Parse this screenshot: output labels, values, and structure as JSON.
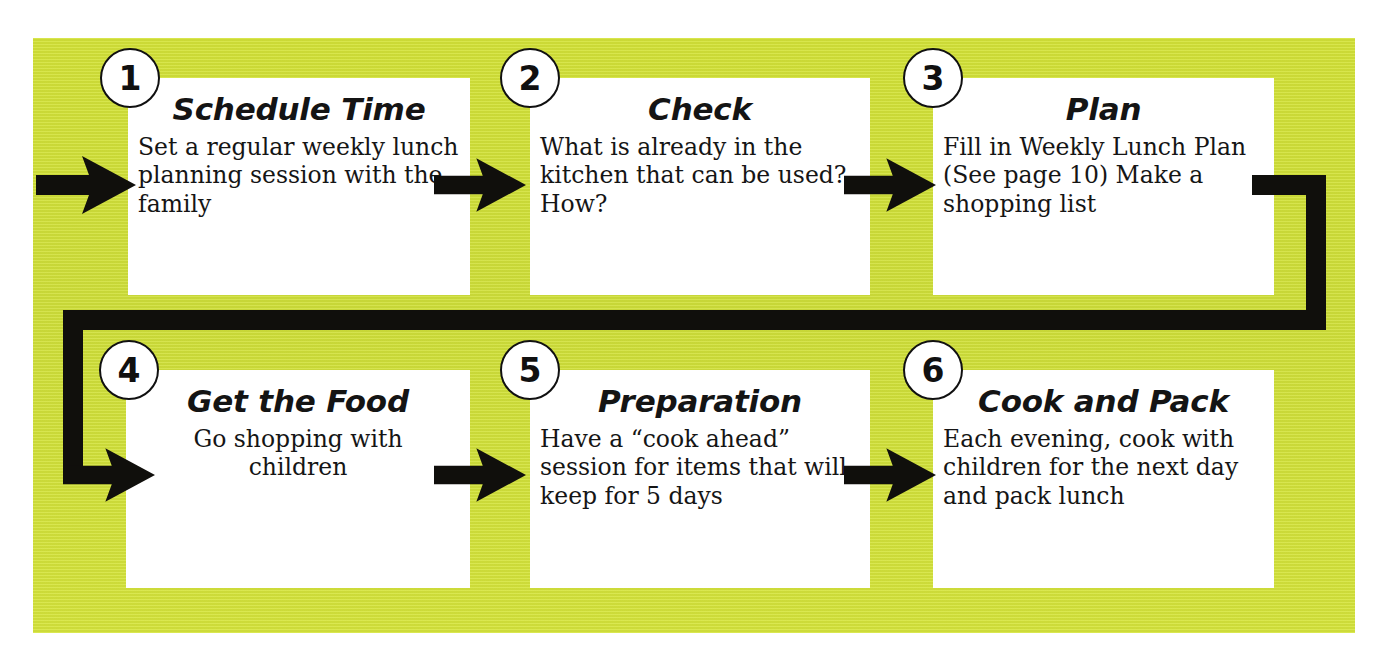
{
  "diagram": {
    "panel_color": "#d2e139",
    "card_color": "#ffffff",
    "line_color": "#100f0c",
    "steps": [
      {
        "number": "1",
        "title": "Schedule Time",
        "body": "Set a regular weekly lunch planning session with the family",
        "align": "left"
      },
      {
        "number": "2",
        "title": "Check",
        "body": "What is already in the kitchen that can be used? How?",
        "align": "left"
      },
      {
        "number": "3",
        "title": "Plan",
        "body": "Fill in Weekly Lunch Plan (See page 10) Make a shopping list",
        "align": "left"
      },
      {
        "number": "4",
        "title": "Get the Food",
        "body": "Go shopping with children",
        "align": "center"
      },
      {
        "number": "5",
        "title": "Preparation",
        "body": "Have a “cook ahead” session for items that will keep for 5 days",
        "align": "left"
      },
      {
        "number": "6",
        "title": "Cook and Pack",
        "body": "Each evening, cook with children for the next day and pack lunch",
        "align": "left"
      }
    ]
  }
}
